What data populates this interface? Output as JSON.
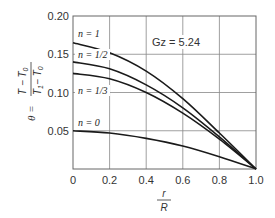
{
  "chart_data": {
    "type": "line",
    "title": "",
    "xlabel": "r/R",
    "ylabel": "θ = (T − T0)/(T1 − T0)",
    "xlim": [
      0,
      1.0
    ],
    "ylim": [
      0,
      0.2
    ],
    "grid": true,
    "x_ticks": [
      "0",
      "0.2",
      "0.4",
      "0.6",
      "0.8",
      "1.0"
    ],
    "y_ticks": [
      "0.05",
      "0.10",
      "0.15",
      "0.20"
    ],
    "annotation": "Gz = 5.24",
    "x": [
      0,
      0.2,
      0.4,
      0.6,
      0.8,
      1.0
    ],
    "series": [
      {
        "name": "n = 1",
        "values": [
          0.165,
          0.152,
          0.128,
          0.092,
          0.047,
          0.0
        ]
      },
      {
        "name": "n = 1/2",
        "values": [
          0.14,
          0.131,
          0.11,
          0.08,
          0.042,
          0.0
        ]
      },
      {
        "name": "n = 1/3",
        "values": [
          0.125,
          0.118,
          0.1,
          0.073,
          0.039,
          0.0
        ]
      },
      {
        "name": "n = 0",
        "values": [
          0.05,
          0.047,
          0.04,
          0.03,
          0.016,
          0.0
        ]
      }
    ],
    "legend_position": "inline labels at left of curves"
  },
  "labels": {
    "ylabel_theta": "θ =",
    "ylabel_num": "T − T",
    "ylabel_num_sub": "0",
    "ylabel_den": "T",
    "ylabel_den_sub1": "1",
    "ylabel_den_mid": "− T",
    "ylabel_den_sub2": "0",
    "xlabel_num": "r",
    "xlabel_den": "R",
    "gz": "Gz = 5.24",
    "n1": "n = 1",
    "n_half": "n = 1/2",
    "n_third": "n = 1/3",
    "n0": "n = 0"
  }
}
